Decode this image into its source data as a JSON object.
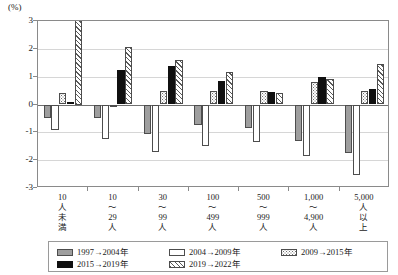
{
  "chart_data": {
    "type": "bar",
    "title": "",
    "xlabel": "",
    "ylabel": "(%)",
    "unit_label": "(%)",
    "ylim": [
      -3,
      3
    ],
    "yticks": [
      3,
      2,
      1,
      0,
      -1,
      -2,
      -3
    ],
    "ytick_labels": [
      "3",
      "2",
      "1",
      "0",
      "-1",
      "-2",
      "-3"
    ],
    "grid": true,
    "legend_position": "bottom",
    "categories": [
      "10\n人\n未\n満",
      "10\n〜\n29\n人",
      "30\n〜\n99\n人",
      "100\n〜\n499\n人",
      "500\n〜\n999\n人",
      "1,000\n〜\n4,900\n人",
      "5,000\n人\n以\n上"
    ],
    "series": [
      {
        "name": "1997→2004年",
        "pattern": "solid-gray",
        "color": "#9e9e9e",
        "values": [
          -0.5,
          -0.5,
          -1.05,
          -0.75,
          -0.85,
          -1.3,
          -1.75
        ]
      },
      {
        "name": "2004→2009年",
        "pattern": "open-white",
        "color": "#ffffff",
        "values": [
          -0.9,
          -1.25,
          -1.7,
          -1.5,
          -1.35,
          -1.85,
          -2.55
        ]
      },
      {
        "name": "2009→2015年",
        "pattern": "dotted",
        "color": "#ffffff",
        "values": [
          0.4,
          -0.05,
          0.5,
          0.5,
          0.5,
          0.8,
          0.5
        ]
      },
      {
        "name": "2015→2019年",
        "pattern": "solid-black",
        "color": "#101010",
        "values": [
          0.1,
          1.25,
          1.4,
          0.85,
          0.45,
          1.0,
          0.55
        ]
      },
      {
        "name": "2019→2022年",
        "pattern": "hatched",
        "color": "#ffffff",
        "values": [
          3.05,
          2.05,
          1.6,
          1.15,
          0.4,
          0.9,
          1.45
        ]
      }
    ]
  }
}
